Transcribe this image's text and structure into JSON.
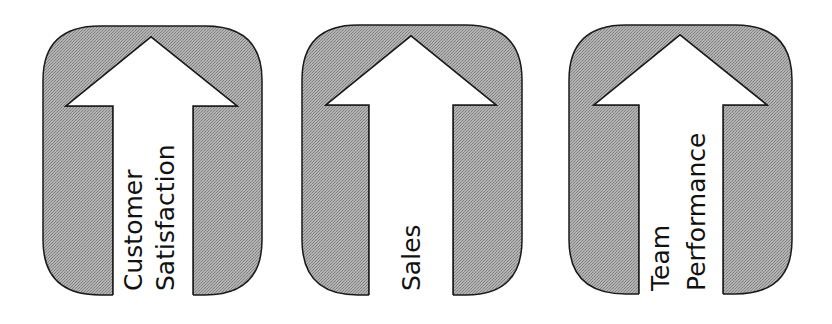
{
  "diagram": {
    "type": "upward-arrow-panels",
    "colors": {
      "panel_fill": "#a9a9a9",
      "panel_stroke": "#1a1a1a",
      "arrow_fill": "#ffffff",
      "text": "#111111",
      "background": "#ffffff"
    },
    "panels": [
      {
        "id": "customer-satisfaction",
        "label_lines": [
          "Customer",
          "Satisfaction"
        ],
        "label": "Customer Satisfaction"
      },
      {
        "id": "sales",
        "label_lines": [
          "Sales"
        ],
        "label": "Sales"
      },
      {
        "id": "team-performance",
        "label_lines": [
          "Team",
          "Performance"
        ],
        "label": "Team Performance"
      }
    ]
  }
}
